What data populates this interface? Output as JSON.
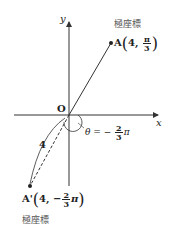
{
  "diagram": {
    "axes": {
      "x_label": "x",
      "y_label": "y",
      "origin_label": "O"
    },
    "point_a": {
      "name": "A",
      "caption": "極座標",
      "r": "4",
      "theta_num": "π",
      "theta_den": "3",
      "sep": ","
    },
    "point_a_prime": {
      "name": "A'",
      "caption": "極座標",
      "r": "4",
      "sign": "−",
      "theta_num": "2",
      "theta_den": "3",
      "theta_suffix": "π",
      "sep": ","
    },
    "angle": {
      "prefix": "θ = −",
      "num": "2",
      "den": "3",
      "suffix": "π"
    },
    "distance_label": "4",
    "colors": {
      "line": "#333333",
      "text": "#222222",
      "caption": "#555555"
    }
  }
}
